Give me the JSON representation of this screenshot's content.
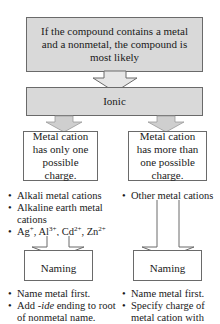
{
  "diagram": {
    "top_box": {
      "text": "If the compound contains a metal and a nonmetal, the compound is most likely"
    },
    "ionic_box": {
      "text": "Ionic"
    },
    "left_branch": {
      "box_text": "Metal cation has only one possible charge.",
      "examples": [
        "Alkali metal cations",
        "Alkaline earth metal cations"
      ],
      "ions": [
        "Ag",
        "+",
        "Al",
        "3+",
        "Cd",
        "2+",
        "Zn",
        "2+"
      ],
      "naming_label": "Naming",
      "rules": [
        "Name metal first.",
        "Add ",
        "-ide",
        " ending to root of nonmetal name."
      ]
    },
    "right_branch": {
      "box_text": "Metal cation has more than one possible charge.",
      "examples": [
        "Other metal cations"
      ],
      "naming_label": "Naming",
      "rules": [
        "Name metal first.",
        "Specify charge of metal cation with"
      ]
    },
    "colors": {
      "box_fill": "#d9d9d9",
      "border": "#6a6a6a",
      "arrow_fill": "#d0d0d0"
    }
  }
}
